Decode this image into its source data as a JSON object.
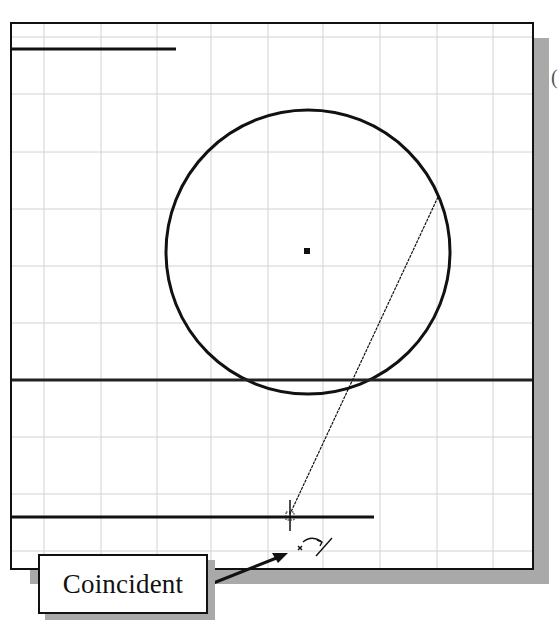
{
  "canvas": {
    "border_color": "#111111",
    "grid_color": "#cfcfcf",
    "shadow_color": "#a9a9a9",
    "grid_spacing_px": 56.5
  },
  "geometry": {
    "top_line": {
      "x1": 12,
      "y1": 49,
      "x2": 176,
      "y2": 49
    },
    "circle": {
      "cx": 308,
      "cy": 252,
      "r": 143
    },
    "circle_center_marker": {
      "x": 307,
      "y": 251
    },
    "middle_line": {
      "x1": 12,
      "y1": 380,
      "x2": 532,
      "y2": 380
    },
    "bottom_line": {
      "x1": 12,
      "y1": 517,
      "x2": 374,
      "y2": 517
    },
    "sketch_line": {
      "x1": 438,
      "y1": 197,
      "x2": 290,
      "y2": 514
    },
    "cursor": {
      "x": 290,
      "y": 516
    }
  },
  "callout": {
    "label": "Coincident"
  },
  "edge_text": "("
}
